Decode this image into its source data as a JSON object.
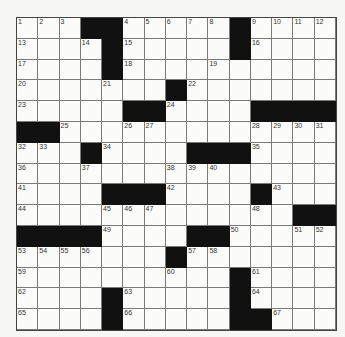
{
  "puzzle": {
    "rows": 15,
    "cols": 15,
    "grid": [
      [
        "1",
        "2",
        "3",
        "#",
        "#",
        "4",
        "5",
        "6",
        "7",
        "8",
        "#",
        "9",
        "10",
        "11",
        "12"
      ],
      [
        "13",
        "",
        "",
        "14",
        "#",
        "15",
        "",
        "",
        "",
        "",
        "#",
        "16",
        "",
        "",
        ""
      ],
      [
        "17",
        "",
        "",
        "",
        "#",
        "18",
        "",
        "",
        "",
        "19",
        "",
        "",
        "",
        "",
        ""
      ],
      [
        "20",
        "",
        "",
        "",
        "21",
        "",
        "",
        "#",
        "22",
        "",
        "",
        "",
        "",
        "",
        ""
      ],
      [
        "23",
        "",
        "",
        "",
        "",
        "#",
        "#",
        "24",
        "",
        "",
        "",
        "#",
        "#",
        "#",
        "#"
      ],
      [
        "#",
        "#",
        "25",
        "",
        "",
        "26",
        "27",
        "",
        "",
        "",
        "",
        "28",
        "29",
        "30",
        "31"
      ],
      [
        "32",
        "33",
        "",
        "#",
        "34",
        "",
        "",
        "",
        "#",
        "#",
        "#",
        "35",
        "",
        "",
        ""
      ],
      [
        "36",
        "",
        "",
        "37",
        "",
        "",
        "",
        "38",
        "39",
        "40",
        "",
        "",
        "",
        "",
        ""
      ],
      [
        "41",
        "",
        "",
        "",
        "#",
        "#",
        "#",
        "42",
        "",
        "",
        "",
        "#",
        "43",
        "",
        ""
      ],
      [
        "44",
        "",
        "",
        "",
        "45",
        "46",
        "47",
        "",
        "",
        "",
        "",
        "48",
        "",
        "#",
        "#"
      ],
      [
        "#",
        "#",
        "#",
        "#",
        "49",
        "",
        "",
        "",
        "#",
        "#",
        "50",
        "",
        "",
        "51",
        "52"
      ],
      [
        "53",
        "54",
        "55",
        "56",
        "",
        "",
        "",
        "#",
        "57",
        "58",
        "",
        "",
        "",
        "",
        ""
      ],
      [
        "59",
        "",
        "",
        "",
        "",
        "",
        "",
        "60",
        "",
        "",
        "#",
        "61",
        "",
        "",
        ""
      ],
      [
        "62",
        "",
        "",
        "",
        "#",
        "63",
        "",
        "",
        "",
        "",
        "#",
        "64",
        "",
        "",
        ""
      ],
      [
        "65",
        "",
        "",
        "",
        "#",
        "66",
        "",
        "",
        "",
        "",
        "#",
        "#",
        "67",
        "",
        ""
      ]
    ],
    "colors": {
      "black": "#111111",
      "white": "#fbfbfa",
      "line": "#7a7a7a"
    }
  }
}
